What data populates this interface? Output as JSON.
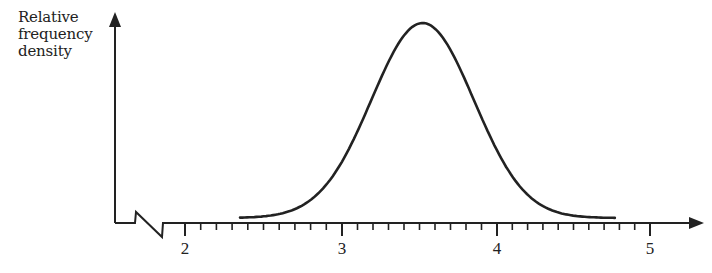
{
  "chart_data": {
    "type": "line",
    "title": "",
    "ylabel": "Relative frequency density",
    "ylabel_lines": [
      "Relative",
      "frequency",
      "density"
    ],
    "xlabel": "",
    "x_tick_labels": [
      "2",
      "3",
      "4",
      "5"
    ],
    "x_ticks_major": [
      2,
      3,
      4,
      5
    ],
    "x_minor_tick_step": 0.1,
    "xlim": [
      1.8,
      5.3
    ],
    "axis_break": "zig-zag on x-axis near origin (axis does not start at 0)",
    "grid": false,
    "legend": null,
    "series": [
      {
        "name": "normal distribution curve",
        "shape": "bell",
        "mean": 3.52,
        "x_start": 2.35,
        "x_end": 4.77,
        "x": [
          2.35,
          2.6,
          2.8,
          3.0,
          3.2,
          3.4,
          3.52,
          3.65,
          3.8,
          4.0,
          4.2,
          4.4,
          4.6,
          4.77
        ],
        "y_relative": [
          0.03,
          0.07,
          0.17,
          0.37,
          0.66,
          0.93,
          1.0,
          0.93,
          0.74,
          0.39,
          0.15,
          0.05,
          0.02,
          0.04
        ]
      }
    ],
    "colors": {
      "line": "#222222",
      "axis": "#222222",
      "background": "#ffffff"
    }
  }
}
